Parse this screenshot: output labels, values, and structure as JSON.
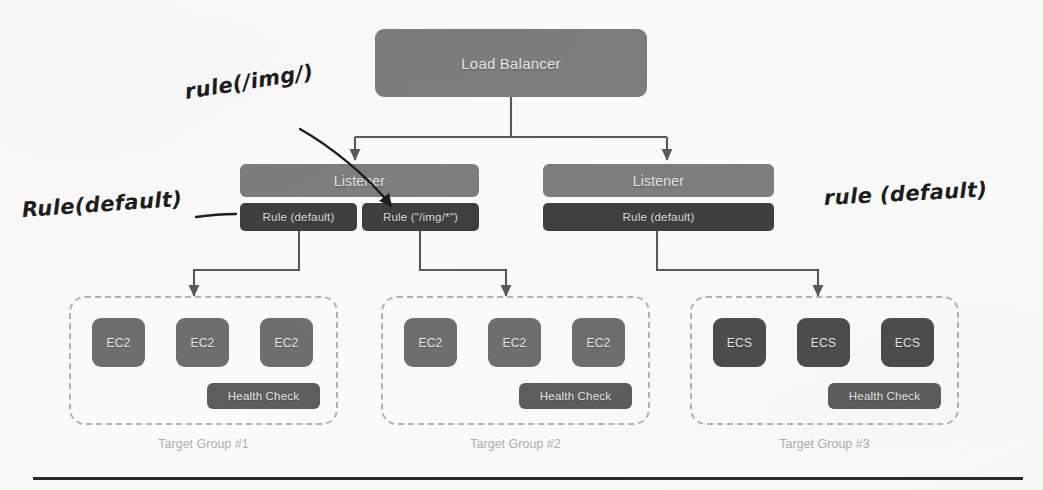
{
  "diagram": {
    "load_balancer": {
      "label": "Load Balancer"
    },
    "listeners": [
      {
        "label": "Listener",
        "rules": [
          {
            "label": "Rule (default)"
          },
          {
            "label": "Rule (\"/img/*\")"
          }
        ]
      },
      {
        "label": "Listener",
        "rules": [
          {
            "label": "Rule (default)"
          }
        ]
      }
    ],
    "target_groups": [
      {
        "label": "Target Group #1",
        "targets": [
          "EC2",
          "EC2",
          "EC2"
        ],
        "target_type": "EC2",
        "health_check": "Health Check"
      },
      {
        "label": "Target Group #2",
        "targets": [
          "EC2",
          "EC2",
          "EC2"
        ],
        "target_type": "EC2",
        "health_check": "Health Check"
      },
      {
        "label": "Target Group #3",
        "targets": [
          "ECS",
          "ECS",
          "ECS"
        ],
        "target_type": "ECS",
        "health_check": "Health Check"
      }
    ],
    "annotations": [
      {
        "text": "rule(/img/)",
        "position": "upper-left"
      },
      {
        "text": "Rule(default)",
        "position": "left"
      },
      {
        "text": "rule (default)",
        "position": "right"
      }
    ],
    "colors": {
      "load_balancer": "#7e7e7e",
      "listener": "#7e7e7e",
      "rule": "#3f3f3f",
      "ec2": "#6f6f6f",
      "ecs": "#4d4d4d",
      "health_check": "#5e5e5e",
      "target_group_border": "#b4b4b4",
      "target_group_label": "#b0b0b0",
      "connector": "#595959",
      "handwriting": "#1d1d1d",
      "background": "#fdfdfc"
    }
  }
}
